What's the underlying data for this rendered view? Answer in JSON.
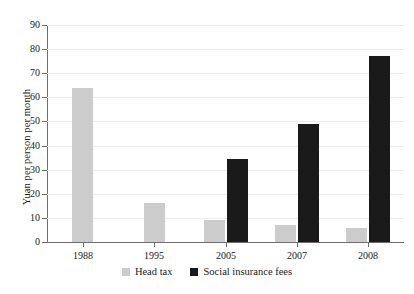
{
  "chart_data": {
    "type": "bar",
    "title": "",
    "xlabel": "",
    "ylabel": "Yuan per person per month",
    "ylim": [
      0,
      90
    ],
    "yticks": [
      0,
      10,
      20,
      30,
      40,
      50,
      60,
      70,
      80,
      90
    ],
    "ytick_labels": [
      "0",
      "10",
      "20",
      "30",
      "40",
      "50",
      "60",
      "70",
      "80",
      "90"
    ],
    "grid": true,
    "legend_position": "bottom-center",
    "categories": [
      "1988",
      "1995",
      "2005",
      "2007",
      "2008"
    ],
    "series": [
      {
        "name": "Head tax",
        "color": "#cccccc",
        "values": [
          64,
          16,
          9,
          7,
          6
        ]
      },
      {
        "name": "Social insurance fees",
        "color": "#1a1a1a",
        "values": [
          null,
          null,
          34.5,
          49,
          77
        ]
      }
    ]
  },
  "legend": {
    "items": [
      {
        "label": "Head tax",
        "swatch": "head-tax"
      },
      {
        "label": "Social insurance fees",
        "swatch": "social"
      }
    ]
  }
}
